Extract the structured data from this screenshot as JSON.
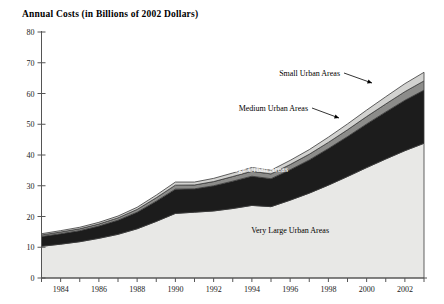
{
  "chart_data": {
    "type": "area",
    "title": "Annual  Costs  (in Billions of 2002 Dollars)",
    "subtitle": "",
    "xlabel": "",
    "ylabel": "",
    "stacked": true,
    "grid": false,
    "legend_position": "inline-annotations",
    "xlim": [
      1983,
      2003
    ],
    "ylim": [
      0,
      80
    ],
    "yticks": [
      0,
      10,
      20,
      30,
      40,
      50,
      60,
      70,
      80
    ],
    "ytick_labels": [
      "0",
      "10",
      "20",
      "30",
      "40",
      "50",
      "60",
      "70",
      "80"
    ],
    "x": [
      1983,
      1984,
      1985,
      1986,
      1987,
      1988,
      1989,
      1990,
      1991,
      1992,
      1993,
      1994,
      1995,
      1996,
      1997,
      1998,
      1999,
      2000,
      2001,
      2002,
      2003
    ],
    "xtick_labels": [
      "",
      "1984",
      "",
      "1986",
      "",
      "1988",
      "",
      "1990",
      "",
      "1992",
      "",
      "1994",
      "",
      "1996",
      "",
      "1998",
      "",
      "2000",
      "",
      "2002",
      ""
    ],
    "xticks_all_years": true,
    "series": [
      {
        "name": "Very Large Urban Areas",
        "color": "#e8e8e6",
        "label_color": "#000000",
        "values": [
          10.3,
          11.0,
          11.8,
          12.9,
          14.2,
          16.0,
          18.4,
          21.0,
          21.4,
          21.8,
          22.6,
          23.6,
          23.2,
          25.3,
          27.6,
          30.2,
          33.0,
          35.9,
          38.7,
          41.4,
          43.8
        ]
      },
      {
        "name": "Large Urban Areas",
        "color": "#1c1c1c",
        "label_color": "#ffffff",
        "values": [
          3.2,
          3.4,
          3.6,
          4.0,
          4.6,
          5.4,
          6.6,
          7.9,
          7.6,
          8.2,
          8.9,
          9.5,
          9.1,
          9.9,
          10.8,
          11.9,
          13.0,
          14.2,
          15.3,
          16.4,
          17.3
        ]
      },
      {
        "name": "Medium Urban Areas",
        "color": "#8c8c8a",
        "label_color": "#000000",
        "values": [
          0.5,
          0.55,
          0.6,
          0.65,
          0.75,
          0.9,
          1.1,
          1.3,
          1.25,
          1.35,
          1.5,
          1.6,
          1.55,
          1.7,
          1.85,
          2.0,
          2.2,
          2.4,
          2.6,
          2.8,
          3.0
        ]
      },
      {
        "name": "Small Urban Areas",
        "color": "#d2d2d0",
        "label_color": "#000000",
        "values": [
          0.4,
          0.45,
          0.5,
          0.55,
          0.6,
          0.7,
          0.85,
          1.0,
          0.95,
          1.05,
          1.15,
          1.25,
          1.2,
          1.35,
          1.5,
          1.7,
          1.9,
          2.1,
          2.35,
          2.6,
          2.8
        ]
      }
    ],
    "annotations": [
      {
        "text": "Small Urban Areas",
        "x": 340,
        "y": 76,
        "anchor": "end",
        "inverse": false
      },
      {
        "text": "Medium Urban Areas",
        "x": 308,
        "y": 111,
        "anchor": "end",
        "inverse": false
      },
      {
        "text": "Large Urban Areas",
        "x": 288,
        "y": 172,
        "anchor": "end",
        "inverse": true
      },
      {
        "text": "Very Large Urban Areas",
        "x": 329,
        "y": 233,
        "anchor": "end",
        "inverse": false
      }
    ],
    "leader_lines": [
      {
        "from_x": 344,
        "from_y": 73,
        "to_x": 372,
        "to_y": 83
      },
      {
        "from_x": 312,
        "from_y": 108,
        "to_x": 339,
        "to_y": 118
      }
    ],
    "axis_color": "#555555",
    "outline_color": "#3a3a3a"
  }
}
